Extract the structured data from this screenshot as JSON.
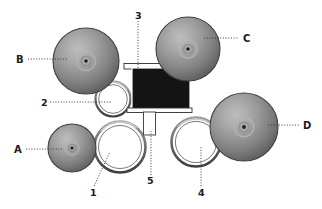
{
  "figure": {
    "background_color": "#ffffff",
    "width": 322,
    "height": 209
  },
  "palette": {
    "sphere_rim": "#4a4a4a",
    "sphere_light": "#c9c9c9",
    "sphere_mid": "#8f8f8f",
    "sphere_dark": "#5b5b5b",
    "sphere_core_dot": "#1c1c1c",
    "ring_outline": "#5a5a5a",
    "ring_fill": "#ffffff",
    "block_fill": "#141414",
    "block_edge": "#ffffff",
    "leader_line": "#3a3a3a",
    "label_text": "#1a1a1a"
  },
  "labels": {
    "letters": [
      {
        "id": "A",
        "text": "A",
        "x": 14,
        "y": 152,
        "leader_from_x": 26,
        "leader_from_y": 149,
        "leader_to_x": 62,
        "leader_to_y": 149,
        "target": "lower-left-sphere"
      },
      {
        "id": "B",
        "text": "B",
        "x": 16,
        "y": 62,
        "leader_from_x": 28,
        "leader_from_y": 59,
        "leader_to_x": 66,
        "leader_to_y": 59,
        "target": "upper-left-sphere"
      },
      {
        "id": "C",
        "text": "C",
        "x": 243,
        "y": 41,
        "leader_from_x": 204,
        "leader_from_y": 38,
        "leader_to_x": 239,
        "leader_to_y": 38,
        "target": "upper-right-sphere"
      },
      {
        "id": "D",
        "text": "D",
        "x": 303,
        "y": 128,
        "leader_from_x": 268,
        "leader_from_y": 125,
        "leader_to_x": 299,
        "leader_to_y": 125,
        "target": "right-sphere"
      }
    ],
    "numbers": [
      {
        "id": "1",
        "text": "1",
        "x": 90,
        "y": 194,
        "leader_from_x": 93,
        "leader_from_y": 186,
        "leader_to_x": 110,
        "leader_to_y": 155,
        "target": "lower-left-ring"
      },
      {
        "id": "2",
        "text": "2",
        "x": 41,
        "y": 105,
        "leader_from_x": 50,
        "leader_from_y": 102,
        "leader_to_x": 110,
        "leader_to_y": 102,
        "target": "upper-left-ring"
      },
      {
        "id": "3",
        "text": "3",
        "x": 135,
        "y": 17,
        "leader_from_x": 138,
        "leader_from_y": 21,
        "leader_to_x": 138,
        "leader_to_y": 68,
        "target": "central-block"
      },
      {
        "id": "4",
        "text": "4",
        "x": 198,
        "y": 194,
        "leader_from_x": 201,
        "leader_from_y": 186,
        "leader_to_x": 201,
        "leader_to_y": 148,
        "target": "lower-right-ring"
      },
      {
        "id": "5",
        "text": "5",
        "x": 147,
        "y": 182,
        "leader_from_x": 151,
        "leader_from_y": 174,
        "leader_to_x": 151,
        "leader_to_y": 131,
        "target": "central-stem"
      }
    ]
  },
  "shapes": {
    "spheres": [
      {
        "name": "upper-left-sphere",
        "cx": 86,
        "cy": 61,
        "r": 33
      },
      {
        "name": "upper-right-sphere",
        "cx": 188,
        "cy": 49,
        "r": 32
      },
      {
        "name": "right-sphere",
        "cx": 244,
        "cy": 127,
        "r": 34
      },
      {
        "name": "lower-left-sphere",
        "cx": 72,
        "cy": 148,
        "r": 24
      }
    ],
    "rings": [
      {
        "name": "upper-left-ring",
        "cx": 113,
        "cy": 99,
        "r": 17
      },
      {
        "name": "lower-left-ring",
        "cx": 120,
        "cy": 147,
        "r": 25
      },
      {
        "name": "lower-right-ring",
        "cx": 196,
        "cy": 142,
        "r": 24
      }
    ],
    "block": {
      "name": "central-block",
      "x": 133,
      "y": 70,
      "width": 57,
      "height": 39
    },
    "block_top_bar": {
      "x": 124,
      "y": 64,
      "width": 60,
      "height": 5
    },
    "block_bottom_bar": {
      "x": 128,
      "y": 108,
      "width": 64,
      "height": 4
    },
    "stem": {
      "name": "central-stem",
      "x": 144,
      "y": 112,
      "width": 12,
      "height": 22
    }
  }
}
